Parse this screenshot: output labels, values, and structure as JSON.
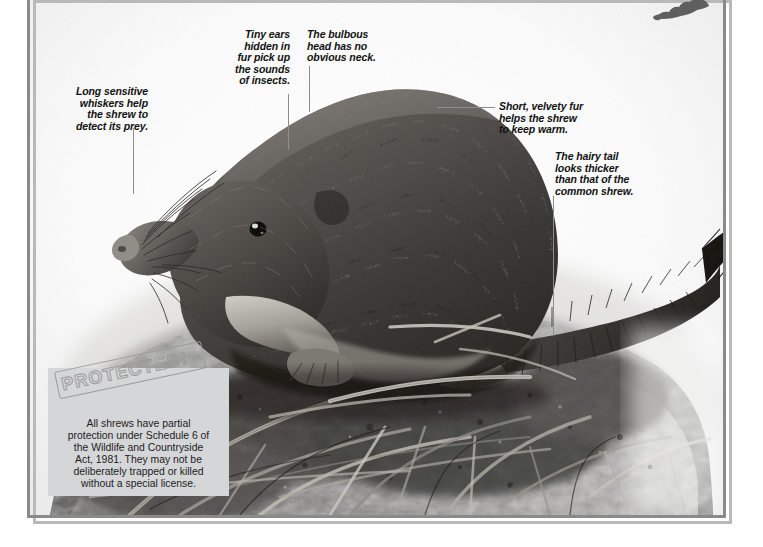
{
  "plate": {
    "subject": "common-shrew-photograph",
    "frame_color": "#8a8a8a",
    "frame_shadow_color": "#b9b9b9",
    "background_color": "#ffffff"
  },
  "map_inset": {
    "name": "distribution-map-silhouette",
    "fill_color": "#5f5f5f"
  },
  "callouts": [
    {
      "id": "whiskers",
      "text": "Long sensitive\nwhiskers help\nthe shrew to\ndetect its prey.",
      "align": "right",
      "x": 62,
      "y": 86,
      "width": 86,
      "leader": {
        "type": "v",
        "x": 133,
        "y": 128,
        "length": 66
      }
    },
    {
      "id": "ears",
      "text": "Tiny ears\nhidden in\nfur pick up\nthe sounds\nof insects.",
      "align": "right",
      "x": 222,
      "y": 29,
      "width": 68,
      "leader": {
        "type": "v",
        "x": 288,
        "y": 94,
        "length": 56
      }
    },
    {
      "id": "head",
      "text": "The bulbous\nhead has no\nobvious neck.",
      "align": "left",
      "x": 307,
      "y": 29,
      "width": 80,
      "leader": {
        "type": "v",
        "x": 309,
        "y": 66,
        "length": 46
      }
    },
    {
      "id": "fur",
      "text": "Short, velvety fur\nhelps the shrew\nto keep warm.",
      "align": "left",
      "x": 499,
      "y": 101,
      "width": 110,
      "leader": {
        "type": "h",
        "x": 437,
        "y": 107,
        "length": 58
      }
    },
    {
      "id": "tail",
      "text": "The hairy tail\nlooks thicker\nthan that of the\ncommon shrew.",
      "align": "left",
      "x": 555,
      "y": 151,
      "width": 96,
      "leader": {
        "type": "v",
        "x": 553,
        "y": 196,
        "length": 140
      }
    }
  ],
  "protected": {
    "stamp_label": "PROTECTED!",
    "body": "All shrews have partial\nprotection under Schedule 6 of\nthe Wildlife and Countryside\nAct, 1981. They may not be\ndeliberately trapped or killed\nwithout a special license.",
    "background_color": "#d5d6d8",
    "stamp_color": "#9a9a9a"
  }
}
